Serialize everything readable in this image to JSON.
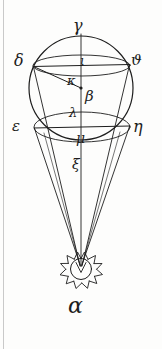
{
  "figure": {
    "ink_color": "#1d1d1d",
    "paper_color": "#fdfdfc",
    "edge_color": "#c9c9c9",
    "labels": {
      "alpha": "α",
      "beta": "β",
      "gamma": "γ",
      "delta": "δ",
      "epsilon": "ε",
      "eta": "η",
      "theta": "ϑ",
      "iota": "ι",
      "kappa": "κ",
      "lambda": "λ",
      "mu": "μ",
      "xi": "ξ"
    },
    "label_roles": {
      "alpha": "sun-symbol-label",
      "beta": "sphere-center-point",
      "gamma": "sphere-top-pole",
      "delta": "upper-left-chord-endpoint",
      "theta": "upper-right-chord-endpoint",
      "epsilon": "lower-left-chord-endpoint",
      "eta": "lower-right-chord-endpoint",
      "iota": "upper-chord-axis-intersection",
      "kappa": "radius-delta-to-beta",
      "lambda": "axis-point-below-center",
      "mu": "lower-chord-axis-intersection",
      "xi": "sphere-bottom-axis-point"
    },
    "geometry": {
      "circle": {
        "cx": 81,
        "cy": 88,
        "r": 52
      },
      "vertical_axis": {
        "x": 81,
        "y_top": 34,
        "y_bottom": 268
      },
      "upper_chord": {
        "x1": 33,
        "y1": 66,
        "x2": 130,
        "y2": 64
      },
      "lower_chord": {
        "x1": 34,
        "y1": 128,
        "x2": 130,
        "y2": 126
      },
      "upper_ellipse_rx": 48,
      "upper_ellipse_ry": 11,
      "lower_ellipse_rx": 48,
      "lower_ellipse_ry": 15,
      "radius_line": {
        "x1": 33,
        "y1": 66,
        "x2": 81,
        "y2": 88
      },
      "apex": {
        "x": 81,
        "y": 268
      },
      "cone_sources": [
        "delta",
        "epsilon",
        "eta",
        "theta"
      ],
      "sun": {
        "cx": 81,
        "cy": 268,
        "r_inner": 11,
        "r_outer": 17,
        "spikes": 13
      }
    }
  }
}
